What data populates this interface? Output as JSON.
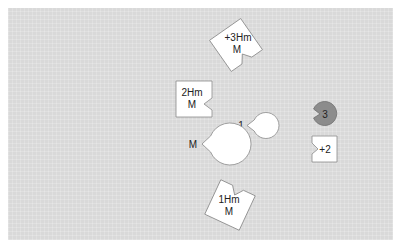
{
  "colors": {
    "board": "#d9d9d9",
    "piece_fill": "#ffffff",
    "piece_stroke": "#8a8a8a",
    "dark_piece_fill": "#8c8c8c",
    "dark_piece_stroke": "#6e6e6e",
    "text": "#222222"
  },
  "pieces": [
    {
      "id": "plus3hm",
      "lines": [
        "+3Hm",
        "M"
      ]
    },
    {
      "id": "2hm",
      "lines": [
        "2Hm",
        "M"
      ]
    },
    {
      "id": "one",
      "lines": [
        "1"
      ]
    },
    {
      "id": "m",
      "lines": [
        "M"
      ]
    },
    {
      "id": "three",
      "lines": [
        "3"
      ]
    },
    {
      "id": "plus2",
      "lines": [
        "+2"
      ]
    },
    {
      "id": "1hm",
      "lines": [
        "1Hm",
        "M"
      ]
    }
  ]
}
